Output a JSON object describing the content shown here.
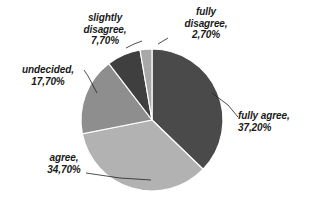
{
  "chart_data": {
    "type": "pie",
    "title": "",
    "categories": [
      "fully agree",
      "agree",
      "undecided",
      "slightly disagree",
      "fully disagree"
    ],
    "values": [
      37.2,
      34.7,
      17.7,
      7.7,
      2.7
    ],
    "value_labels": [
      "37,20%",
      "34,70%",
      "17,70%",
      "7,70%",
      "2,70%"
    ],
    "unit": "%",
    "start_angle_deg": 0,
    "direction": "clockwise",
    "legend": "none",
    "labels_position": "outside-with-leader-lines",
    "colors": [
      "#4a4a4a",
      "#b2b2b2",
      "#8e8e8e",
      "#3f3f3f",
      "#a8a8a8"
    ],
    "slices": [
      {
        "name": "fully agree",
        "label_line1": "fully agree,",
        "label_line2": "37,20%",
        "value": 37.2,
        "color": "#4a4a4a"
      },
      {
        "name": "agree",
        "label_line1": "agree,",
        "label_line2": "34,70%",
        "value": 34.7,
        "color": "#b2b2b2"
      },
      {
        "name": "undecided",
        "label_line1": "undecided,",
        "label_line2": "17,70%",
        "value": 17.7,
        "color": "#8e8e8e"
      },
      {
        "name": "slightly disagree",
        "label_line1": "slightly",
        "label_line2": "disagree,",
        "label_line3": "7,70%",
        "value": 7.7,
        "color": "#3f3f3f"
      },
      {
        "name": "fully disagree",
        "label_line1": "fully",
        "label_line2": "disagree,",
        "label_line3": "2,70%",
        "value": 2.7,
        "color": "#a8a8a8"
      }
    ]
  },
  "labels": {
    "fully_agree": {
      "line1": "fully agree,",
      "line2": "37,20%"
    },
    "agree": {
      "line1": "agree,",
      "line2": "34,70%"
    },
    "undecided": {
      "line1": "undecided,",
      "line2": "17,70%"
    },
    "slightly_disagree": {
      "line1": "slightly",
      "line2": "disagree,",
      "line3": "7,70%"
    },
    "fully_disagree": {
      "line1": "fully",
      "line2": "disagree,",
      "line3": "2,70%"
    }
  }
}
